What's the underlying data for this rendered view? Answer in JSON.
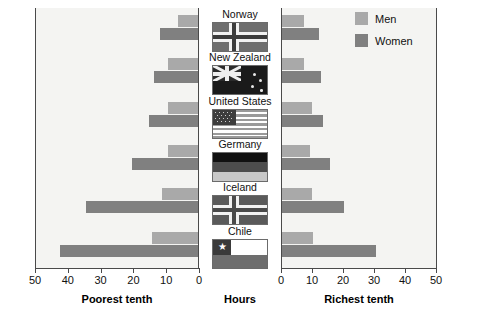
{
  "chart_data": {
    "type": "bar",
    "title": "",
    "subtitle": "",
    "orientation": "horizontal",
    "layout": "back-to-back paired panels",
    "categories": [
      "Norway",
      "New Zealand",
      "United States",
      "Germany",
      "Iceland",
      "Chile"
    ],
    "panels": [
      {
        "name": "left",
        "xlabel": "Poorest tenth",
        "xlim": [
          50,
          0
        ],
        "direction": "reversed",
        "ticks": [
          50,
          40,
          30,
          20,
          10,
          0
        ],
        "series": [
          {
            "name": "Men",
            "values": [
              6,
              9,
              9,
              9,
              11,
              14
            ]
          },
          {
            "name": "Women",
            "values": [
              11.5,
              13.5,
              15,
              20,
              34,
              42
            ]
          }
        ]
      },
      {
        "name": "right",
        "xlabel": "Richest tenth",
        "xlim": [
          0,
          50
        ],
        "direction": "normal",
        "ticks": [
          0,
          10,
          20,
          30,
          40,
          50
        ],
        "series": [
          {
            "name": "Men",
            "values": [
              7,
              7,
              9.5,
              9,
              9.5,
              10
            ]
          },
          {
            "name": "Women",
            "values": [
              12,
              12.5,
              13,
              15.5,
              20,
              30
            ]
          }
        ]
      }
    ],
    "center_axis_label": "Hours",
    "ylabel": "",
    "grid": false,
    "legend": {
      "position": "top-right",
      "entries": [
        {
          "label": "Men",
          "color": "#a9a9a9"
        },
        {
          "label": "Women",
          "color": "#808080"
        }
      ]
    }
  },
  "axes": {
    "left": {
      "title": "Poorest tenth",
      "ticks": [
        "50",
        "40",
        "30",
        "20",
        "10",
        "0"
      ]
    },
    "center": {
      "title": "Hours"
    },
    "right": {
      "title": "Richest tenth",
      "ticks": [
        "0",
        "10",
        "20",
        "30",
        "40",
        "50"
      ]
    }
  },
  "legend": {
    "men_label": "Men",
    "women_label": "Women",
    "men_color": "#a9a9a9",
    "women_color": "#808080"
  },
  "countries": [
    {
      "name": "Norway",
      "flag": "flag-norway"
    },
    {
      "name": "New Zealand",
      "flag": "flag-new-zealand"
    },
    {
      "name": "United States",
      "flag": "flag-united-states"
    },
    {
      "name": "Germany",
      "flag": "flag-germany"
    },
    {
      "name": "Iceland",
      "flag": "flag-iceland"
    },
    {
      "name": "Chile",
      "flag": "flag-chile"
    }
  ]
}
